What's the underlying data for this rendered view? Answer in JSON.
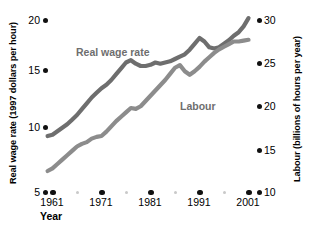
{
  "chart_data": {
    "type": "line",
    "title": "",
    "xlabel": "Year",
    "x_tick_labels": [
      "1961",
      "1971",
      "1981",
      "1991",
      "2001"
    ],
    "x_ticks": [
      1961,
      1971,
      1981,
      1991,
      2001
    ],
    "xlim": [
      1959,
      2002
    ],
    "grid": false,
    "legend_position": "inline-annotation",
    "axes": [
      {
        "id": "left",
        "ylabel": "Real wage rate (1997 dollars per hour)",
        "ylim": [
          5,
          20
        ],
        "y_tick_labels": [
          "5",
          "10",
          "15",
          "20"
        ],
        "y_ticks": [
          5,
          10,
          15,
          20
        ]
      },
      {
        "id": "right",
        "ylabel": "Labour (billions of hours per year)",
        "ylim": [
          10,
          30
        ],
        "y_tick_labels": [
          "10",
          "15",
          "20",
          "25",
          "30"
        ],
        "y_ticks": [
          10,
          15,
          20,
          25,
          30
        ]
      }
    ],
    "series": [
      {
        "name": "Real wage rate",
        "axis": "left",
        "color": "#6e6e6e",
        "x": [
          1960,
          1961,
          1962,
          1963,
          1964,
          1965,
          1966,
          1967,
          1968,
          1969,
          1970,
          1971,
          1972,
          1973,
          1974,
          1975,
          1976,
          1977,
          1978,
          1979,
          1980,
          1981,
          1982,
          1983,
          1984,
          1985,
          1986,
          1987,
          1988,
          1989,
          1990,
          1991,
          1992,
          1993,
          1994,
          1995,
          1996,
          1997,
          1998,
          1999,
          2000,
          2001
        ],
        "values": [
          9.8,
          9.9,
          10.2,
          10.5,
          10.8,
          11.2,
          11.6,
          12.1,
          12.6,
          13.1,
          13.5,
          13.9,
          14.2,
          14.6,
          15.1,
          15.6,
          16.1,
          16.3,
          16.0,
          15.8,
          15.8,
          15.9,
          16.1,
          16.0,
          16.1,
          16.2,
          16.4,
          16.6,
          16.8,
          17.2,
          17.7,
          18.2,
          17.9,
          17.4,
          17.3,
          17.4,
          17.7,
          18.0,
          18.4,
          18.7,
          19.2,
          19.9
        ]
      },
      {
        "name": "Labour",
        "axis": "right",
        "color": "#8c8c8c",
        "x": [
          1960,
          1961,
          1962,
          1963,
          1964,
          1965,
          1966,
          1967,
          1968,
          1969,
          1970,
          1971,
          1972,
          1973,
          1974,
          1975,
          1976,
          1977,
          1978,
          1979,
          1980,
          1981,
          1982,
          1983,
          1984,
          1985,
          1986,
          1987,
          1988,
          1989,
          1990,
          1991,
          1992,
          1993,
          1994,
          1995,
          1996,
          1997,
          1998,
          1999,
          2000,
          2001
        ],
        "values": [
          12.4,
          12.7,
          13.2,
          13.7,
          14.2,
          14.7,
          15.2,
          15.5,
          15.7,
          16.1,
          16.3,
          16.4,
          16.9,
          17.5,
          18.1,
          18.6,
          19.1,
          19.6,
          19.5,
          19.8,
          20.4,
          21.0,
          21.6,
          22.2,
          22.8,
          23.5,
          24.2,
          24.5,
          23.8,
          23.4,
          23.8,
          24.3,
          24.9,
          25.4,
          25.9,
          26.3,
          26.6,
          26.9,
          27.2,
          27.2,
          27.3,
          27.4
        ]
      }
    ]
  },
  "labels": {
    "y_left_title": "Real wage rate (1997 dollars per hour)",
    "y_right_title": "Labour (billions of hours per year)",
    "x_axis_title": "Year",
    "series_real_wage": "Real wage rate",
    "series_labour": "Labour",
    "y_left_20": "20",
    "y_left_15": "15",
    "y_left_10": "10",
    "y_left_5": "5",
    "y_right_30": "30",
    "y_right_25": "25",
    "y_right_20": "20",
    "y_right_15": "15",
    "y_right_10": "10",
    "x_1961": "1961",
    "x_1971": "1971",
    "x_1981": "1981",
    "x_1991": "1991",
    "x_2001": "2001"
  },
  "colors": {
    "series_real_wage": "#6e6e6e",
    "series_labour": "#8c8c8c",
    "tick_dot": "#111111",
    "tick_dot_minor": "#c9c9c9",
    "background": "#ffffff"
  }
}
